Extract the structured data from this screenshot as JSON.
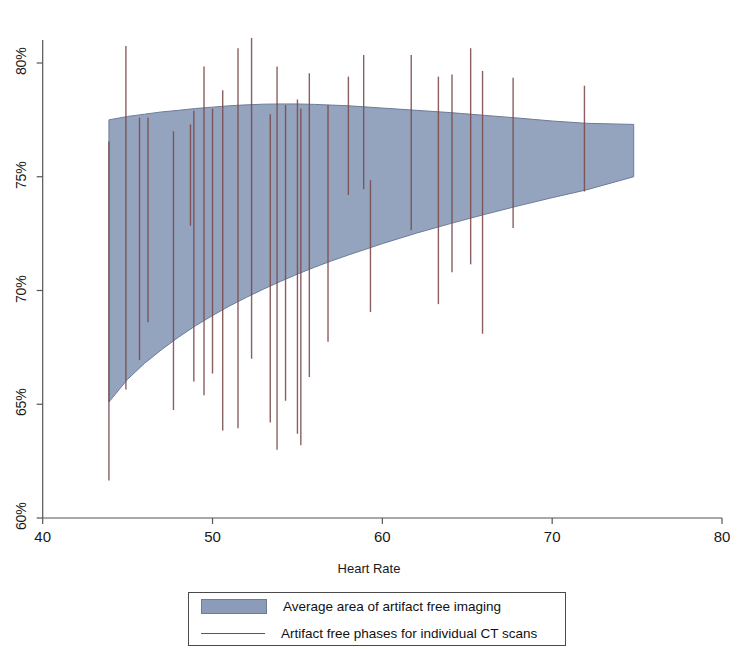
{
  "chart_data": {
    "type": "area",
    "title": "",
    "subtitle": "",
    "xlabel": "Heart Rate",
    "ylabel": "",
    "xlim": [
      40,
      80
    ],
    "ylim": [
      0.6,
      0.82
    ],
    "grid": false,
    "legend_position": "bottom",
    "x_ticks": [
      40,
      50,
      60,
      70,
      80
    ],
    "x_tick_labels": [
      "40",
      "50",
      "60",
      "70",
      "80"
    ],
    "y_ticks": [
      0.6,
      0.65,
      0.7,
      0.75,
      0.8
    ],
    "y_tick_labels": [
      "60%",
      "65%",
      "70%",
      "75%",
      "80%"
    ],
    "colors": {
      "band_fill": "#8c9cb8",
      "band_edge": "#6c7c98",
      "scan_line": "#7a4a4a",
      "axis": "#555555",
      "text": "#1a1a1a"
    },
    "series": [
      {
        "name": "Average area of artifact free imaging",
        "type": "band",
        "x": [
          43.9,
          45.0,
          46.0,
          47.0,
          48.0,
          49.0,
          50.0,
          51.0,
          52.0,
          53.0,
          54.0,
          55.0,
          56.0,
          57.0,
          58.0,
          60.0,
          62.0,
          64.0,
          66.0,
          68.0,
          70.0,
          72.0,
          74.8
        ],
        "upper": [
          0.775,
          0.7765,
          0.7775,
          0.7785,
          0.7792,
          0.78,
          0.7806,
          0.7812,
          0.7816,
          0.7819,
          0.782,
          0.782,
          0.7818,
          0.7815,
          0.7812,
          0.7802,
          0.7792,
          0.7782,
          0.777,
          0.7758,
          0.7745,
          0.7735,
          0.773
        ],
        "lower": [
          0.651,
          0.661,
          0.668,
          0.674,
          0.6795,
          0.6845,
          0.689,
          0.6932,
          0.697,
          0.7006,
          0.704,
          0.7072,
          0.7102,
          0.713,
          0.7156,
          0.7206,
          0.7252,
          0.7294,
          0.7334,
          0.7372,
          0.7408,
          0.7442,
          0.75
        ]
      },
      {
        "name": "Artifact free phases for individual CT scans",
        "type": "vline-segments",
        "segments": [
          {
            "x": 43.9,
            "y0": 0.6165,
            "y1": 0.7655
          },
          {
            "x": 44.9,
            "y0": 0.6565,
            "y1": 0.8075
          },
          {
            "x": 45.7,
            "y0": 0.6695,
            "y1": 0.776
          },
          {
            "x": 46.2,
            "y0": 0.686,
            "y1": 0.776
          },
          {
            "x": 47.7,
            "y0": 0.6475,
            "y1": 0.77
          },
          {
            "x": 48.7,
            "y0": 0.7285,
            "y1": 0.773
          },
          {
            "x": 48.9,
            "y0": 0.66,
            "y1": 0.779
          },
          {
            "x": 49.5,
            "y0": 0.654,
            "y1": 0.7985
          },
          {
            "x": 50.0,
            "y0": 0.6635,
            "y1": 0.78
          },
          {
            "x": 50.6,
            "y0": 0.6385,
            "y1": 0.788
          },
          {
            "x": 51.5,
            "y0": 0.6395,
            "y1": 0.8065
          },
          {
            "x": 52.3,
            "y0": 0.67,
            "y1": 0.811
          },
          {
            "x": 53.4,
            "y0": 0.642,
            "y1": 0.7775
          },
          {
            "x": 53.8,
            "y0": 0.63,
            "y1": 0.7985
          },
          {
            "x": 54.3,
            "y0": 0.6515,
            "y1": 0.7815
          },
          {
            "x": 55.0,
            "y0": 0.637,
            "y1": 0.784
          },
          {
            "x": 55.2,
            "y0": 0.632,
            "y1": 0.78
          },
          {
            "x": 55.7,
            "y0": 0.662,
            "y1": 0.7955
          },
          {
            "x": 56.8,
            "y0": 0.6775,
            "y1": 0.7815
          },
          {
            "x": 58.0,
            "y0": 0.742,
            "y1": 0.794
          },
          {
            "x": 58.9,
            "y0": 0.7445,
            "y1": 0.8035
          },
          {
            "x": 59.3,
            "y0": 0.6905,
            "y1": 0.7485
          },
          {
            "x": 61.7,
            "y0": 0.7265,
            "y1": 0.8035
          },
          {
            "x": 63.3,
            "y0": 0.694,
            "y1": 0.794
          },
          {
            "x": 64.1,
            "y0": 0.708,
            "y1": 0.795
          },
          {
            "x": 65.2,
            "y0": 0.7115,
            "y1": 0.8065
          },
          {
            "x": 65.9,
            "y0": 0.681,
            "y1": 0.7965
          },
          {
            "x": 67.7,
            "y0": 0.7275,
            "y1": 0.7935
          },
          {
            "x": 71.9,
            "y0": 0.7435,
            "y1": 0.79
          }
        ]
      }
    ]
  },
  "legend": {
    "items": [
      {
        "label": "Average area of artifact free imaging",
        "marker": "filled-box"
      },
      {
        "label": "Artifact free phases for individual CT scans",
        "marker": "line"
      }
    ]
  },
  "axis": {
    "x_title": "Heart Rate"
  }
}
